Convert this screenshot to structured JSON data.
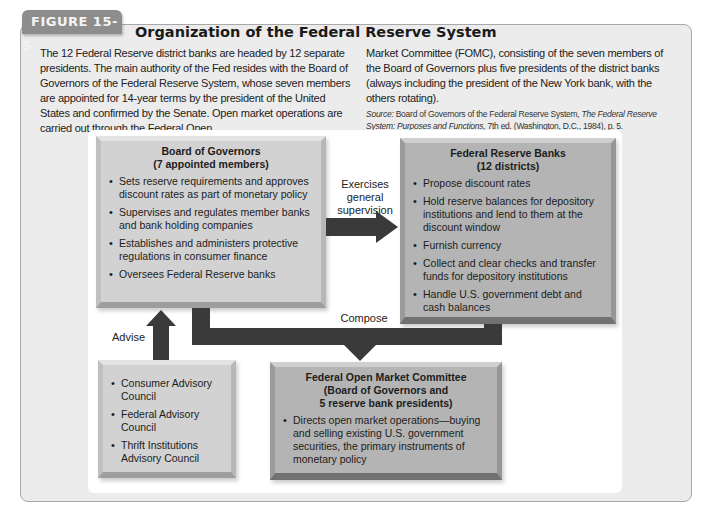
{
  "figure": {
    "label": "FIGURE 15-5",
    "title": "Organization of the Federal Reserve System"
  },
  "caption": {
    "left": "The 12 Federal Reserve district banks are headed by 12 separate presidents. The main authority of the Fed resides with the Board of Governors of the Federal Reserve System, whose seven members are appointed for 14-year terms by the president of the United States and confirmed by the Senate. Open market operations are carried out through the Federal Open",
    "right": "Market Committee (FOMC), consisting of the seven members of the Board of Governors plus five presidents of the district banks (always including the president of the New York bank, with the others rotating).",
    "source_label": "Source:",
    "source_text": "Board of Governors of the Federal Reserve System,",
    "source_title": "The Federal Reserve System: Purposes and Functions,",
    "source_tail": "7th ed. (Washington, D.C., 1984), p. 5."
  },
  "diagram": {
    "board": {
      "title_line1": "Board of Governors",
      "title_line2": "(7 appointed members)",
      "items": [
        "Sets reserve requirements and approves discount rates as part of monetary policy",
        "Supervises and regulates member banks and bank holding companies",
        "Establishes and administers protective regulations in consumer finance",
        "Oversees Federal Reserve banks"
      ]
    },
    "banks": {
      "title_line1": "Federal Reserve Banks",
      "title_line2": "(12 districts)",
      "items": [
        "Propose discount rates",
        "Hold reserve balances for depository institutions and lend to them at the discount window",
        "Furnish currency",
        "Collect and clear checks and transfer funds for depository institutions",
        "Handle U.S. government debt and cash balances"
      ]
    },
    "advisory": {
      "items": [
        "Consumer Advisory Council",
        "Federal Advisory Council",
        "Thrift Institutions Advisory Council"
      ]
    },
    "fomc": {
      "title_line1": "Federal Open Market Committee",
      "title_line2": "(Board of Governors and",
      "title_line3": "5 reserve bank presidents)",
      "items": [
        "Directs open market operations—buying and selling existing U.S. government securities, the primary instruments of monetary policy"
      ]
    },
    "arrows": {
      "supervision": "Exercises general supervision",
      "supervision_l1": "Exercises",
      "supervision_l2": "general",
      "supervision_l3": "supervision",
      "compose": "Compose",
      "advise": "Advise"
    },
    "colors": {
      "arrow": "#3a3a3a",
      "light_box": "#d2d2d2",
      "dark_box": "#b4b4b4",
      "figure_tab": "#8d8d8d"
    }
  }
}
